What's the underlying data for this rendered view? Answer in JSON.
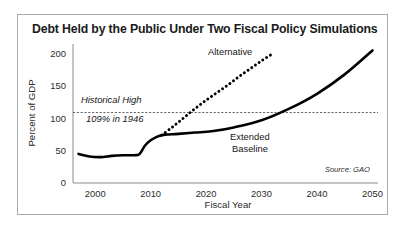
{
  "figure": {
    "title": "Debt Held by the Public Under Two Fiscal Policy Simulations",
    "source_note": "Source: GAO"
  },
  "chart_data": {
    "type": "line",
    "title": "Debt Held by the Public Under Two Fiscal Policy Simulations",
    "xlabel": "Fiscal Year",
    "ylabel": "Percent of GDP",
    "xlim": [
      1996,
      2051
    ],
    "ylim": [
      0,
      215
    ],
    "xticks": [
      2000,
      2010,
      2020,
      2030,
      2040,
      2050
    ],
    "xtick_labels": [
      "2000",
      "2010",
      "2020",
      "2030",
      "2040",
      "2050"
    ],
    "yticks": [
      0,
      50,
      100,
      150,
      200
    ],
    "ytick_labels": [
      "0",
      "50",
      "100",
      "150",
      "200"
    ],
    "grid": false,
    "legend_position": "inline-annotations",
    "reference_line": {
      "value": 109,
      "style": "dashed",
      "label_line1": "Historical High",
      "label_line2": "109% in 1946"
    },
    "annotations": [
      {
        "text": "Alternative",
        "x": 2021,
        "y": 188
      },
      {
        "text": "Extended",
        "x": 2034,
        "y": 62
      },
      {
        "text": "Baseline",
        "x": 2034,
        "y": 50
      },
      {
        "text": "Source: GAO",
        "x": 2048,
        "y": 22
      }
    ],
    "series": [
      {
        "name": "Extended Baseline",
        "style": "solid",
        "x": [
          1997,
          1999,
          2001,
          2003,
          2005,
          2007,
          2008,
          2009,
          2010,
          2011,
          2012,
          2013,
          2015,
          2018,
          2021,
          2025,
          2030,
          2035,
          2040,
          2045,
          2050
        ],
        "values": [
          45,
          41,
          40,
          42,
          43,
          43,
          45,
          58,
          66,
          71,
          74,
          75,
          76,
          78,
          80,
          86,
          97,
          115,
          138,
          168,
          205
        ]
      },
      {
        "name": "Alternative",
        "style": "dotted",
        "x": [
          2012,
          2014,
          2016,
          2018,
          2020,
          2022,
          2024,
          2026,
          2028,
          2030,
          2032
        ],
        "values": [
          74,
          87,
          101,
          115,
          128,
          140,
          152,
          165,
          177,
          189,
          200
        ]
      }
    ]
  }
}
